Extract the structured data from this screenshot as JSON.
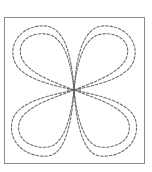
{
  "figure": {
    "width": 152,
    "height": 172,
    "background": "#ffffff",
    "frame": {
      "x": 4.5,
      "y": 17.5,
      "width": 140,
      "height": 146,
      "stroke": "#8a8a8a",
      "stroke_width": 1
    },
    "center": {
      "x": 74,
      "y": 90
    },
    "petal_style": {
      "stroke": "#6e6e6e",
      "stroke_width": 1.1,
      "dasharray": "2.6 1.8"
    },
    "petals": [
      {
        "name": "top-left-outer",
        "d": "M74,90 C58,86 20,80 14,60 C8,40 26,24 46,26 C66,28 72,60 74,90 Z"
      },
      {
        "name": "top-left-inner",
        "d": "M74,90 C60,84 26,74 21,56 C17,42 30,32 46,34 C64,36 71,62 74,90 Z"
      },
      {
        "name": "top-right-outer",
        "d": "M74,90 C90,86 128,80 134,60 C140,40 122,24 102,26 C82,28 76,60 74,90 Z"
      },
      {
        "name": "top-right-inner",
        "d": "M74,90 C88,84 122,74 127,56 C131,42 118,32 102,34 C84,36 77,62 74,90 Z"
      },
      {
        "name": "bottom-left-outer",
        "d": "M74,90 C58,94 16,100 12,122 C8,144 28,158 48,156 C66,154 72,120 74,90 Z"
      },
      {
        "name": "bottom-left-inner",
        "d": "M74,90 C60,96 22,106 19,124 C16,140 32,149 48,147 C64,145 71,118 74,90 Z"
      },
      {
        "name": "bottom-right-outer",
        "d": "M74,90 C90,94 132,100 136,122 C140,144 120,158 100,156 C82,154 76,120 74,90 Z"
      },
      {
        "name": "bottom-right-inner",
        "d": "M74,90 C88,96 126,106 129,124 C132,140 116,149 100,147 C84,145 77,118 74,90 Z"
      }
    ],
    "center_mark": {
      "stroke": "#555555",
      "stroke_width": 1.2,
      "half_length": 7
    }
  }
}
